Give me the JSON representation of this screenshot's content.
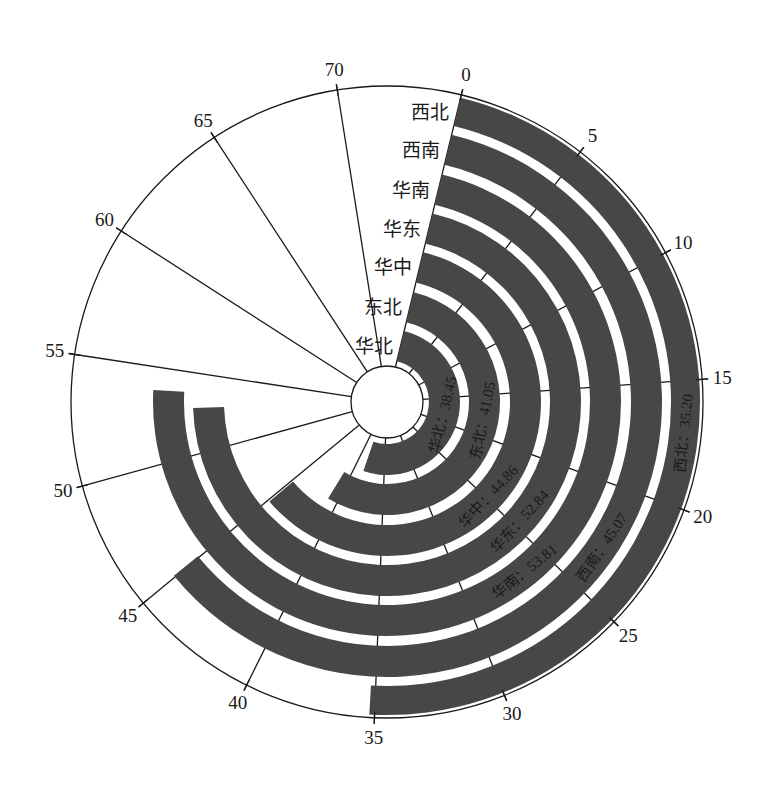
{
  "chart_data": {
    "type": "radial-bar",
    "title": "",
    "categories": [
      "华北",
      "东北",
      "华中",
      "华东",
      "华南",
      "西南",
      "西北"
    ],
    "values": [
      38.45,
      41.05,
      44.86,
      52.84,
      53.81,
      45.07,
      35.2
    ],
    "value_labels": [
      "华北：38.45",
      "东北：41.05",
      "华中：44.86",
      "华东：52.84",
      "华南：53.81",
      "西南：45.07",
      "西北：35.20"
    ],
    "ring_order": "inner-to-outer",
    "axis": {
      "ticks": [
        0,
        5,
        10,
        15,
        20,
        25,
        30,
        35,
        40,
        45,
        50,
        55,
        60,
        65,
        70
      ],
      "tick_labels": [
        "0",
        "5",
        "10",
        "15",
        "20",
        "25",
        "30",
        "35",
        "40",
        "45",
        "50",
        "55",
        "60",
        "65",
        "70"
      ],
      "range": [
        0,
        74.7
      ],
      "direction": "clockwise",
      "start_angle_deg": 13.6
    },
    "grid": true,
    "legend": "none",
    "colors": {
      "bar": "#474747",
      "line": "#1a1a1a",
      "background": "#ffffff"
    }
  }
}
